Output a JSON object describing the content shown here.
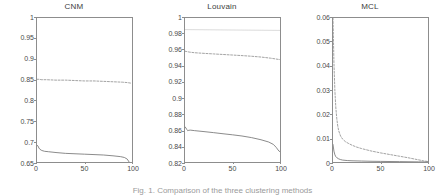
{
  "figure": {
    "caption": "Fig. 1. Comparison of the three clustering methods",
    "panel_positions": [
      0,
      148,
      296
    ]
  },
  "colors": {
    "axis": "#8d8d8d",
    "solid_curve": "#6b6b6b",
    "dashed_curve": "#8a8a8a",
    "faint_curve": "#d6d6d6",
    "text": "#4a4a4a",
    "background": "#ffffff"
  },
  "chart_data": [
    {
      "type": "line",
      "title": "CNM",
      "xlabel": "",
      "ylabel": "",
      "xlim": [
        0,
        100
      ],
      "ylim": [
        0.65,
        1
      ],
      "grid": false,
      "legend": "none",
      "xticks": [
        0,
        50,
        100
      ],
      "xtick_labels": [
        "0",
        "50",
        "100"
      ],
      "yticks": [
        0.65,
        0.7,
        0.75,
        0.8,
        0.85,
        0.9,
        0.95,
        1
      ],
      "ytick_labels": [
        "0.65",
        "0.7",
        "0.75",
        "0.8",
        "0.85",
        "0.9",
        "0.95",
        "1"
      ],
      "series": [
        {
          "name": "upper-dashed",
          "style": "dashed",
          "x": [
            0,
            2,
            5,
            10,
            20,
            30,
            40,
            50,
            60,
            70,
            80,
            90,
            95,
            98,
            100
          ],
          "values": [
            0.851,
            0.851,
            0.85,
            0.85,
            0.849,
            0.849,
            0.848,
            0.847,
            0.847,
            0.846,
            0.845,
            0.844,
            0.843,
            0.842,
            0.841
          ]
        },
        {
          "name": "lower-solid",
          "style": "solid",
          "x": [
            0,
            1,
            2,
            3,
            5,
            8,
            12,
            20,
            30,
            40,
            50,
            60,
            70,
            80,
            88,
            92,
            95,
            97,
            98,
            99,
            100
          ],
          "values": [
            0.691,
            0.689,
            0.684,
            0.681,
            0.678,
            0.676,
            0.675,
            0.673,
            0.671,
            0.67,
            0.669,
            0.668,
            0.667,
            0.665,
            0.663,
            0.661,
            0.657,
            0.65,
            0.643,
            0.635,
            0.633
          ]
        }
      ]
    },
    {
      "type": "line",
      "title": "Louvain",
      "xlabel": "",
      "ylabel": "",
      "xlim": [
        0,
        100
      ],
      "ylim": [
        0.82,
        1
      ],
      "grid": false,
      "legend": "none",
      "xticks": [
        0,
        50,
        100
      ],
      "xtick_labels": [
        "0",
        "50",
        "100"
      ],
      "yticks": [
        0.82,
        0.84,
        0.86,
        0.88,
        0.9,
        0.92,
        0.94,
        0.96,
        0.98,
        1
      ],
      "ytick_labels": [
        "0.82",
        "0.84",
        "0.86",
        "0.88",
        "0.9",
        "0.92",
        "0.94",
        "0.96",
        "0.98",
        "1"
      ],
      "series": [
        {
          "name": "top-faint",
          "style": "faint",
          "x": [
            0,
            20,
            40,
            60,
            80,
            100
          ],
          "values": [
            0.9855,
            0.9853,
            0.9851,
            0.9849,
            0.9847,
            0.9845
          ]
        },
        {
          "name": "middle-dashed",
          "style": "dashed",
          "x": [
            0,
            2,
            5,
            10,
            20,
            30,
            40,
            50,
            60,
            70,
            80,
            90,
            95,
            98,
            100
          ],
          "values": [
            0.9585,
            0.958,
            0.9573,
            0.9566,
            0.9558,
            0.9551,
            0.9544,
            0.9537,
            0.953,
            0.9522,
            0.9512,
            0.9498,
            0.9489,
            0.9483,
            0.948
          ]
        },
        {
          "name": "lower-solid",
          "style": "solid",
          "x": [
            0,
            1,
            2,
            3,
            4,
            6,
            10,
            20,
            30,
            40,
            50,
            60,
            70,
            80,
            88,
            93,
            96,
            98,
            99,
            100
          ],
          "values": [
            0.864,
            0.8625,
            0.8605,
            0.859,
            0.8597,
            0.8598,
            0.8592,
            0.858,
            0.8567,
            0.8553,
            0.854,
            0.8525,
            0.8505,
            0.8478,
            0.845,
            0.842,
            0.8383,
            0.835,
            0.8335,
            0.833
          ]
        }
      ]
    },
    {
      "type": "line",
      "title": "MCL",
      "xlabel": "",
      "ylabel": "",
      "xlim": [
        0,
        100
      ],
      "ylim": [
        0,
        0.06
      ],
      "grid": false,
      "legend": "none",
      "xticks": [
        0,
        50,
        100
      ],
      "xtick_labels": [
        "0",
        "50",
        "100"
      ],
      "yticks": [
        0,
        0.01,
        0.02,
        0.03,
        0.04,
        0.05,
        0.06
      ],
      "ytick_labels": [
        "0",
        "0.01",
        "0.02",
        "0.03",
        "0.04",
        "0.05",
        "0.06"
      ],
      "series": [
        {
          "name": "upper-dashed",
          "style": "dashed",
          "x": [
            0,
            1,
            2,
            3,
            4,
            5,
            6,
            8,
            10,
            13,
            16,
            20,
            25,
            30,
            35,
            40,
            50,
            60,
            70,
            80,
            90,
            95,
            100
          ],
          "values": [
            0.06,
            0.041,
            0.0295,
            0.0225,
            0.018,
            0.015,
            0.013,
            0.0108,
            0.0096,
            0.0085,
            0.0078,
            0.007,
            0.0062,
            0.0056,
            0.0051,
            0.0046,
            0.0038,
            0.0031,
            0.0024,
            0.0017,
            0.0009,
            0.0005,
            0.0002
          ]
        },
        {
          "name": "lower-solid",
          "style": "solid",
          "x": [
            0,
            1,
            2,
            3,
            4,
            6,
            8,
            10,
            15,
            20,
            30,
            40,
            50,
            60,
            70,
            80,
            90,
            100
          ],
          "values": [
            0.0073,
            0.0045,
            0.003,
            0.0022,
            0.0018,
            0.0013,
            0.001,
            0.0008,
            0.0006,
            0.0005,
            0.0004,
            0.0003,
            0.00025,
            0.0002,
            0.00015,
            0.0001,
            5e-05,
            0.0
          ]
        }
      ]
    }
  ]
}
